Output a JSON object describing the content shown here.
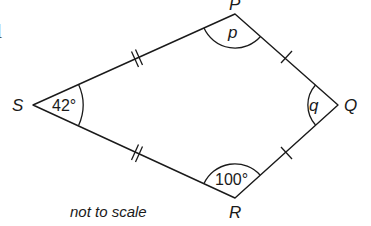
{
  "diagram": {
    "type": "kite",
    "stray_glyph": "l",
    "vertices": {
      "S": {
        "label": "S",
        "x": 33,
        "y": 105
      },
      "P": {
        "label": "P",
        "x": 235,
        "y": 14
      },
      "Q": {
        "label": "Q",
        "x": 338,
        "y": 105
      },
      "R": {
        "label": "R",
        "x": 235,
        "y": 198
      }
    },
    "angles": {
      "S": {
        "label": "42°"
      },
      "P": {
        "label": "p"
      },
      "Q": {
        "label": "q"
      },
      "R": {
        "label": "100°"
      }
    },
    "equal_sides": {
      "double_tick": [
        "SP",
        "SR"
      ],
      "single_tick": [
        "PQ",
        "RQ"
      ]
    },
    "note": "not to scale"
  }
}
